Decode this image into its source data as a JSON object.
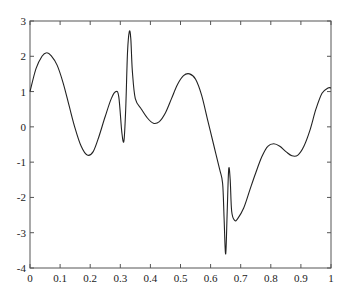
{
  "chart_data": {
    "type": "line",
    "title": "",
    "xlabel": "",
    "ylabel": "",
    "xlim": [
      0,
      1
    ],
    "ylim": [
      -4,
      3
    ],
    "grid": false,
    "legend": null,
    "x_ticks": [
      "0",
      "0.1",
      "0.2",
      "0.3",
      "0.4",
      "0.5",
      "0.6",
      "0.7",
      "0.8",
      "0.9",
      "1"
    ],
    "y_ticks": [
      "3",
      "2",
      "1",
      "0",
      "-1",
      "-2",
      "-3",
      "-4"
    ],
    "series": [
      {
        "name": "signal",
        "color": "#222222",
        "x": [
          0,
          0.02,
          0.04,
          0.055,
          0.07,
          0.09,
          0.11,
          0.13,
          0.15,
          0.17,
          0.19,
          0.21,
          0.23,
          0.25,
          0.27,
          0.285,
          0.295,
          0.305,
          0.312,
          0.318,
          0.324,
          0.33,
          0.335,
          0.34,
          0.35,
          0.37,
          0.39,
          0.41,
          0.43,
          0.45,
          0.47,
          0.49,
          0.51,
          0.53,
          0.55,
          0.57,
          0.59,
          0.61,
          0.63,
          0.64,
          0.645,
          0.65,
          0.655,
          0.66,
          0.665,
          0.67,
          0.68,
          0.69,
          0.71,
          0.73,
          0.75,
          0.77,
          0.79,
          0.81,
          0.83,
          0.85,
          0.87,
          0.89,
          0.91,
          0.93,
          0.95,
          0.97,
          0.99,
          1.0
        ],
        "values": [
          1.0,
          1.65,
          2.0,
          2.1,
          2.02,
          1.75,
          1.25,
          0.6,
          -0.05,
          -0.55,
          -0.8,
          -0.7,
          -0.25,
          0.3,
          0.8,
          1.0,
          0.85,
          -0.15,
          -0.4,
          0.5,
          2.1,
          2.7,
          2.5,
          1.6,
          0.8,
          0.5,
          0.25,
          0.1,
          0.15,
          0.4,
          0.8,
          1.2,
          1.45,
          1.5,
          1.35,
          0.9,
          0.2,
          -0.5,
          -1.2,
          -1.6,
          -2.6,
          -3.6,
          -2.4,
          -1.2,
          -1.5,
          -2.4,
          -2.65,
          -2.6,
          -2.3,
          -1.8,
          -1.3,
          -0.85,
          -0.55,
          -0.48,
          -0.55,
          -0.7,
          -0.82,
          -0.8,
          -0.55,
          -0.1,
          0.5,
          0.95,
          1.1,
          1.1
        ]
      }
    ]
  }
}
